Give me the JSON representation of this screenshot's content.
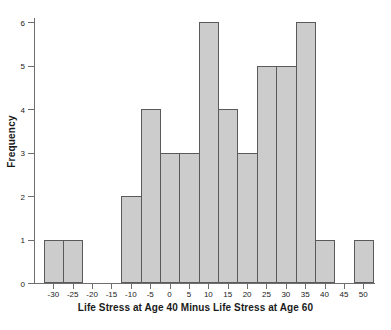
{
  "chart_data": {
    "type": "bar",
    "title": "",
    "xlabel": "Life Stress at Age 40 Minus Life Stress at Age 60",
    "ylabel": "Frequency",
    "xlim": [
      -35,
      52.5
    ],
    "ylim": [
      0,
      6
    ],
    "grid": false,
    "legend": null,
    "bin_width": 5,
    "bar_color": "#cccccc",
    "bar_edge_color": "#5a5a5a",
    "axis_color": "#6e6e6e",
    "text_color": "#1a1a1a",
    "xticks": [
      -30,
      -25,
      -20,
      -15,
      -10,
      -5,
      0,
      5,
      10,
      15,
      20,
      25,
      30,
      35,
      40,
      45,
      50
    ],
    "xtick_labels": [
      "-30",
      "-25",
      "-20",
      "-15",
      "-10",
      "-5",
      "0",
      "5",
      "10",
      "15",
      "20",
      "25",
      "30",
      "35",
      "40",
      "45",
      "50"
    ],
    "yticks": [
      0,
      1,
      2,
      3,
      4,
      5,
      6
    ],
    "ytick_labels": [
      "0",
      "1",
      "2",
      "3",
      "4",
      "5",
      "6"
    ],
    "categories": [
      -30,
      -25,
      -20,
      -15,
      -10,
      -5,
      0,
      5,
      10,
      15,
      20,
      25,
      30,
      35,
      40,
      45,
      50
    ],
    "values": [
      1,
      1,
      0,
      0,
      2,
      4,
      3,
      3,
      6,
      4,
      3,
      5,
      5,
      6,
      1,
      0,
      1
    ],
    "bins": [
      {
        "center": -30,
        "left": -32.5,
        "right": -27.5,
        "count": 1
      },
      {
        "center": -25,
        "left": -27.5,
        "right": -22.5,
        "count": 1
      },
      {
        "center": -20,
        "left": -22.5,
        "right": -17.5,
        "count": 0
      },
      {
        "center": -15,
        "left": -17.5,
        "right": -12.5,
        "count": 0
      },
      {
        "center": -10,
        "left": -12.5,
        "right": -7.5,
        "count": 2
      },
      {
        "center": -5,
        "left": -7.5,
        "right": -2.5,
        "count": 4
      },
      {
        "center": 0,
        "left": -2.5,
        "right": 2.5,
        "count": 3
      },
      {
        "center": 5,
        "left": 2.5,
        "right": 7.5,
        "count": 3
      },
      {
        "center": 10,
        "left": 7.5,
        "right": 12.5,
        "count": 6
      },
      {
        "center": 15,
        "left": 12.5,
        "right": 17.5,
        "count": 4
      },
      {
        "center": 20,
        "left": 17.5,
        "right": 22.5,
        "count": 3
      },
      {
        "center": 25,
        "left": 22.5,
        "right": 27.5,
        "count": 5
      },
      {
        "center": 30,
        "left": 27.5,
        "right": 32.5,
        "count": 5
      },
      {
        "center": 35,
        "left": 32.5,
        "right": 37.5,
        "count": 6
      },
      {
        "center": 40,
        "left": 37.5,
        "right": 42.5,
        "count": 1
      },
      {
        "center": 45,
        "left": 42.5,
        "right": 47.5,
        "count": 0
      },
      {
        "center": 50,
        "left": 47.5,
        "right": 52.5,
        "count": 1
      }
    ]
  }
}
